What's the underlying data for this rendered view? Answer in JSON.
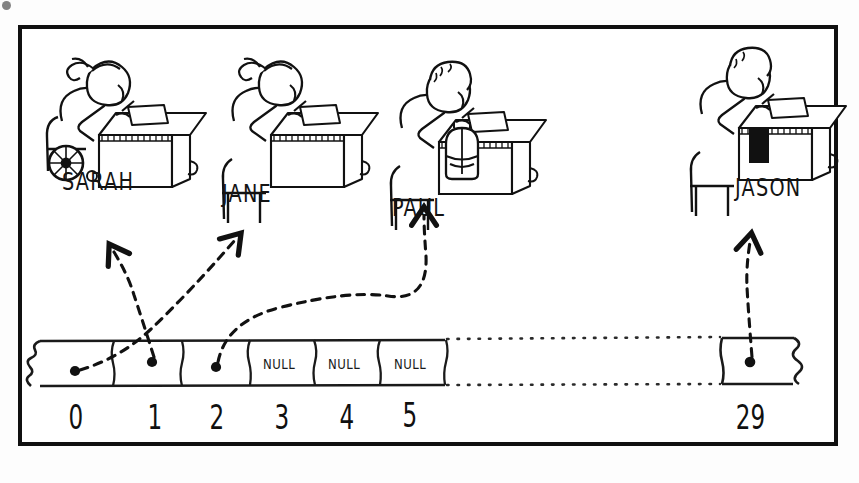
{
  "figure": {
    "style": "hand-drawn sketch",
    "ink_color": "#111111",
    "paper_color": "#ffffff",
    "border_color": "#101010"
  },
  "students": [
    {
      "id": "sarah",
      "name": "SARAH",
      "icon": "student-at-desk-wheelchair-icon",
      "seat_feature": "wheelchair",
      "points_from_index": 1
    },
    {
      "id": "jane",
      "name": "JANE",
      "icon": "student-at-desk-icon",
      "seat_feature": "chair",
      "points_from_index": 0
    },
    {
      "id": "paul",
      "name": "PAUL",
      "icon": "student-at-desk-backpack-icon",
      "seat_feature": "backpack under desk",
      "points_from_index": 2
    },
    {
      "id": "jason",
      "name": "JASON",
      "icon": "student-at-desk-book-icon",
      "seat_feature": "black book in desk",
      "points_from_index": 29
    }
  ],
  "array": {
    "name": "students",
    "length": 30,
    "left_edge": "torn",
    "right_edge": "torn",
    "gap_style": "dotted",
    "cells": [
      {
        "index": "0",
        "value": "pointer",
        "label": "",
        "has_dot": true
      },
      {
        "index": "1",
        "value": "pointer",
        "label": "",
        "has_dot": true
      },
      {
        "index": "2",
        "value": "pointer",
        "label": "",
        "has_dot": true
      },
      {
        "index": "3",
        "value": "null",
        "label": "NULL",
        "has_dot": false
      },
      {
        "index": "4",
        "value": "null",
        "label": "NULL",
        "has_dot": false
      },
      {
        "index": "5",
        "value": "null",
        "label": "NULL",
        "has_dot": false
      },
      {
        "index": "29",
        "value": "pointer",
        "label": "",
        "has_dot": true
      }
    ],
    "index_labels": [
      "0",
      "1",
      "2",
      "3",
      "4",
      "5",
      "29"
    ]
  },
  "arrows": [
    {
      "id": "arrow-0-to-jane",
      "from": "0",
      "to": "JANE"
    },
    {
      "id": "arrow-1-to-sarah",
      "from": "1",
      "to": "SARAH"
    },
    {
      "id": "arrow-2-to-paul",
      "from": "2",
      "to": "PAUL"
    },
    {
      "id": "arrow-29-to-jason",
      "from": "29",
      "to": "JASON"
    }
  ]
}
